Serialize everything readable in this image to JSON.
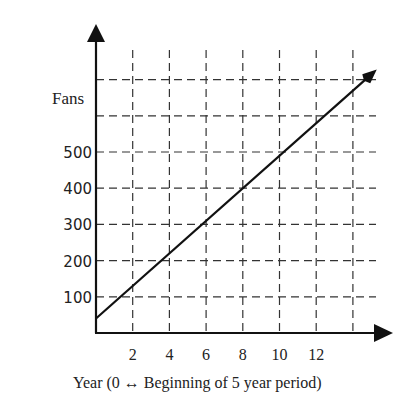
{
  "chart_data": {
    "type": "line",
    "title": "",
    "ylabel": "Fans",
    "xlabel": "Year (0 ↔ Beginning of 5 year period)",
    "x_ticks": [
      2,
      4,
      6,
      8,
      10,
      12
    ],
    "y_ticks": [
      100,
      200,
      300,
      400,
      500
    ],
    "xlim": [
      0,
      14
    ],
    "ylim": [
      0,
      700
    ],
    "grid": true,
    "grid_style": "dashed",
    "series": [
      {
        "name": "Fans",
        "x": [
          0,
          2,
          4,
          6,
          8,
          10,
          12,
          14,
          15.3
        ],
        "values": [
          40,
          130,
          220,
          310,
          400,
          490,
          580,
          670,
          728
        ],
        "arrow_end": true
      }
    ]
  },
  "labels": {
    "y_axis": "Fans",
    "x_axis": "Year (0 ↔ Beginning of 5 year period)",
    "x_ticks": [
      "2",
      "4",
      "6",
      "8",
      "10",
      "12"
    ],
    "y_ticks": [
      "100",
      "200",
      "300",
      "400",
      "500"
    ]
  }
}
